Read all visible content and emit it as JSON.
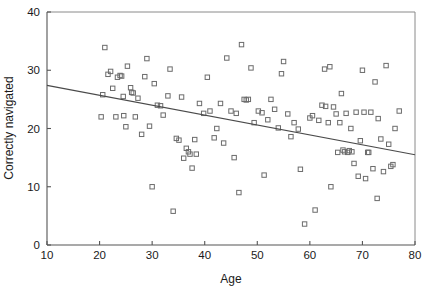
{
  "chart_data": {
    "type": "scatter",
    "title": "",
    "xlabel": "Age",
    "ylabel": "Correctly navigated",
    "xlim": [
      10,
      80
    ],
    "ylim": [
      0,
      40
    ],
    "xticks": [
      10,
      20,
      30,
      40,
      50,
      60,
      70,
      80
    ],
    "yticks": [
      0,
      10,
      20,
      30,
      40
    ],
    "xtick_labels": [
      "10",
      "20",
      "30",
      "40",
      "50",
      "60",
      "70",
      "80"
    ],
    "ytick_labels": [
      "0",
      "10",
      "20",
      "30",
      "40"
    ],
    "grid": false,
    "legend": null,
    "marker_style": "open-square",
    "marker_color": "#6b6b6b",
    "series": [
      {
        "name": "Participants",
        "points": [
          [
            20.3,
            22.0
          ],
          [
            20.6,
            25.8
          ],
          [
            21.0,
            33.9
          ],
          [
            21.6,
            29.3
          ],
          [
            22.1,
            29.8
          ],
          [
            22.5,
            26.9
          ],
          [
            23.1,
            22.0
          ],
          [
            23.4,
            28.8
          ],
          [
            23.9,
            29.1
          ],
          [
            24.2,
            29.0
          ],
          [
            24.5,
            25.5
          ],
          [
            24.6,
            22.2
          ],
          [
            25.0,
            20.3
          ],
          [
            25.3,
            30.7
          ],
          [
            25.9,
            27.0
          ],
          [
            26.1,
            26.2
          ],
          [
            26.4,
            26.1
          ],
          [
            26.8,
            22.0
          ],
          [
            27.3,
            25.2
          ],
          [
            28.0,
            19.0
          ],
          [
            28.6,
            28.9
          ],
          [
            29.0,
            32.0
          ],
          [
            29.5,
            20.4
          ],
          [
            30.0,
            10.0
          ],
          [
            30.4,
            27.7
          ],
          [
            31.0,
            24.0
          ],
          [
            31.6,
            23.9
          ],
          [
            32.1,
            22.3
          ],
          [
            33.0,
            25.6
          ],
          [
            33.4,
            30.2
          ],
          [
            34.0,
            5.8
          ],
          [
            34.6,
            18.3
          ],
          [
            35.1,
            18.0
          ],
          [
            35.6,
            25.4
          ],
          [
            36.0,
            14.9
          ],
          [
            36.5,
            16.6
          ],
          [
            36.9,
            16.0
          ],
          [
            37.2,
            15.6
          ],
          [
            37.6,
            13.2
          ],
          [
            38.1,
            18.1
          ],
          [
            38.4,
            15.6
          ],
          [
            39.0,
            24.3
          ],
          [
            39.8,
            22.6
          ],
          [
            40.5,
            28.8
          ],
          [
            41.0,
            23.0
          ],
          [
            41.8,
            18.4
          ],
          [
            42.3,
            20.0
          ],
          [
            43.0,
            24.3
          ],
          [
            43.6,
            17.5
          ],
          [
            44.2,
            32.1
          ],
          [
            45.0,
            23.0
          ],
          [
            45.6,
            15.0
          ],
          [
            46.0,
            22.6
          ],
          [
            46.5,
            9.0
          ],
          [
            47.0,
            34.4
          ],
          [
            47.5,
            25.0
          ],
          [
            47.9,
            24.9
          ],
          [
            48.3,
            25.0
          ],
          [
            48.8,
            30.4
          ],
          [
            49.4,
            21.0
          ],
          [
            50.2,
            23.0
          ],
          [
            50.9,
            22.7
          ],
          [
            51.3,
            12.0
          ],
          [
            52.0,
            21.5
          ],
          [
            52.6,
            25.0
          ],
          [
            53.3,
            23.3
          ],
          [
            54.0,
            20.1
          ],
          [
            54.6,
            29.4
          ],
          [
            55.0,
            31.5
          ],
          [
            55.8,
            22.5
          ],
          [
            56.4,
            18.6
          ],
          [
            57.0,
            21.0
          ],
          [
            57.8,
            19.9
          ],
          [
            58.2,
            13.0
          ],
          [
            59.0,
            3.6
          ],
          [
            60.0,
            21.8
          ],
          [
            60.5,
            22.2
          ],
          [
            61.0,
            6.0
          ],
          [
            61.7,
            21.4
          ],
          [
            62.3,
            24.0
          ],
          [
            62.8,
            30.2
          ],
          [
            63.0,
            23.8
          ],
          [
            63.5,
            21.0
          ],
          [
            63.8,
            30.6
          ],
          [
            64.0,
            10.0
          ],
          [
            64.5,
            23.7
          ],
          [
            65.0,
            22.5
          ],
          [
            65.3,
            15.9
          ],
          [
            65.7,
            21.0
          ],
          [
            66.0,
            26.0
          ],
          [
            66.3,
            16.3
          ],
          [
            66.6,
            16.0
          ],
          [
            66.9,
            22.6
          ],
          [
            67.2,
            15.9
          ],
          [
            67.5,
            16.2
          ],
          [
            67.8,
            20.0
          ],
          [
            68.0,
            16.0
          ],
          [
            68.4,
            14.0
          ],
          [
            68.8,
            22.8
          ],
          [
            69.2,
            11.8
          ],
          [
            69.6,
            17.9
          ],
          [
            70.0,
            30.0
          ],
          [
            70.3,
            22.8
          ],
          [
            70.6,
            11.4
          ],
          [
            71.0,
            15.9
          ],
          [
            71.2,
            15.9
          ],
          [
            71.6,
            22.8
          ],
          [
            72.0,
            13.1
          ],
          [
            72.4,
            28.0
          ],
          [
            72.8,
            8.0
          ],
          [
            73.0,
            21.7
          ],
          [
            73.5,
            18.2
          ],
          [
            74.0,
            12.6
          ],
          [
            74.5,
            30.8
          ],
          [
            75.0,
            17.3
          ],
          [
            75.4,
            13.5
          ],
          [
            75.8,
            13.8
          ],
          [
            76.2,
            20.0
          ],
          [
            77.0,
            23.0
          ]
        ]
      }
    ],
    "trend_line": {
      "name": "linear-fit",
      "x_start": 10,
      "y_start": 27.4,
      "x_end": 80,
      "y_end": 15.5,
      "color": "#4a4a4a"
    }
  }
}
